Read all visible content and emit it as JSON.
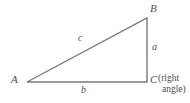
{
  "figure": {
    "kind": "right-triangle-geometry-diagram",
    "background_color": "#ffffff",
    "stroke_color": "#7a7a7a",
    "text_color": "#4d4d4d"
  },
  "vertices": {
    "a": {
      "label": "A",
      "x": 27,
      "y": 82
    },
    "b": {
      "label": "B",
      "x": 147,
      "y": 18
    },
    "c": {
      "label": "C",
      "x": 147,
      "y": 82
    }
  },
  "annotations": {
    "right_angle_note_line1": "(right",
    "right_angle_note_line2": "angle)"
  },
  "sides": {
    "hypotenuse": {
      "label": "c",
      "from": "A",
      "to": "B"
    },
    "opposite": {
      "label": "a",
      "from": "B",
      "to": "C"
    },
    "adjacent": {
      "label": "b",
      "from": "A",
      "to": "C"
    }
  },
  "paths": {
    "triangle": "M 27 82 L 147 18 L 147 82 Z"
  }
}
